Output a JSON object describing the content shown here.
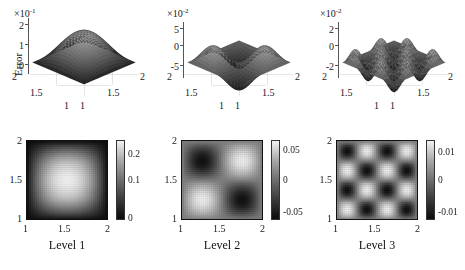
{
  "figure": {
    "ylabel": "Error",
    "background": "#ffffff",
    "colormap": "grayscale"
  },
  "chart_data": [
    {
      "type": "surface",
      "panel": "top-left",
      "title": "",
      "ylabel": "Error",
      "exponent_mantissa": "×10",
      "exponent_power": "-1",
      "zticks": [
        "2",
        "1",
        "0"
      ],
      "zlim": [
        0,
        0.25
      ],
      "xticks": [
        "2",
        "1.5",
        "1"
      ],
      "yticks": [
        "1",
        "1.5",
        "2"
      ],
      "xlim": [
        1,
        2
      ],
      "ylim": [
        1,
        2
      ],
      "description": "single central peak, value decays to zero at all four boundaries",
      "peak_value": 0.25,
      "level": 1
    },
    {
      "type": "surface",
      "panel": "top-middle",
      "title": "",
      "ylabel": "",
      "exponent_mantissa": "×10",
      "exponent_power": "-2",
      "zticks": [
        "5",
        "0",
        "-5"
      ],
      "zlim": [
        -0.06,
        0.06
      ],
      "xticks": [
        "2",
        "1.5",
        "1"
      ],
      "yticks": [
        "1",
        "1.5",
        "2"
      ],
      "xlim": [
        1,
        2
      ],
      "ylim": [
        1,
        2
      ],
      "description": "2x2 oscillation, one positive central ridge with negative lobes at corners",
      "peak_value": 0.05,
      "trough_value": -0.05,
      "level": 2
    },
    {
      "type": "surface",
      "panel": "top-right",
      "title": "",
      "ylabel": "",
      "exponent_mantissa": "×10",
      "exponent_power": "-2",
      "zticks": [
        "2",
        "0",
        "-2"
      ],
      "zlim": [
        -0.025,
        0.025
      ],
      "xticks": [
        "2",
        "1.5",
        "1"
      ],
      "yticks": [
        "1",
        "1.5",
        "2"
      ],
      "xlim": [
        1,
        2
      ],
      "ylim": [
        1,
        2
      ],
      "description": "4x4 oscillation, multiple alternating peaks and troughs",
      "peak_value": 0.02,
      "trough_value": -0.02,
      "level": 3
    },
    {
      "type": "heatmap",
      "panel": "bottom-left",
      "caption": "Level 1",
      "xticks": [
        "1",
        "1.5",
        "2"
      ],
      "yticks": [
        "2",
        "1.5",
        "1"
      ],
      "xlim": [
        1,
        2
      ],
      "ylim": [
        1,
        2
      ],
      "colorbar_ticks": [
        "0.2",
        "0.1",
        "0"
      ],
      "clim": [
        0,
        0.25
      ],
      "grid": true,
      "description": "dark field with a single bright diagonal ridge running lower-left to upper-right"
    },
    {
      "type": "heatmap",
      "panel": "bottom-middle",
      "caption": "Level 2",
      "xticks": [
        "1",
        "1.5",
        "2"
      ],
      "yticks": [
        "2",
        "1.5",
        "1"
      ],
      "xlim": [
        1,
        2
      ],
      "ylim": [
        1,
        2
      ],
      "colorbar_ticks": [
        "0.05",
        "0",
        "-0.05"
      ],
      "clim": [
        -0.06,
        0.06
      ],
      "grid": true,
      "description": "2x2 block pattern, dark diagonal lobes upper-left and lower-right, bright lobes upper-right and lower-left"
    },
    {
      "type": "heatmap",
      "panel": "bottom-right",
      "caption": "Level 3",
      "xticks": [
        "1",
        "1.5",
        "2"
      ],
      "yticks": [
        "2",
        "1.5",
        "1"
      ],
      "xlim": [
        1,
        2
      ],
      "ylim": [
        1,
        2
      ],
      "colorbar_ticks": [
        "0.01",
        "0",
        "-0.01"
      ],
      "clim": [
        -0.013,
        0.013
      ],
      "grid": true,
      "description": "4x4 checkerboard of alternating dark and bright diagonal lobes"
    }
  ]
}
